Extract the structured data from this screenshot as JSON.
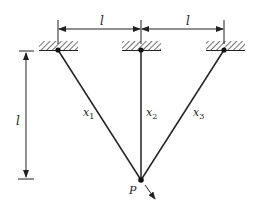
{
  "diagram": {
    "type": "three-bar truss / hanging cables",
    "labels": {
      "top_dim_left": "l",
      "top_dim_right": "l",
      "vertical_dim": "l",
      "bar1": "x",
      "bar1_sub": "1",
      "bar2": "x",
      "bar2_sub": "2",
      "bar3": "x",
      "bar3_sub": "3",
      "load_point": "P"
    },
    "supports": [
      {
        "name": "support-left",
        "x": 58,
        "y": 50
      },
      {
        "name": "support-middle",
        "x": 141,
        "y": 50
      },
      {
        "name": "support-right",
        "x": 224,
        "y": 50
      }
    ],
    "node": {
      "x": 141,
      "y": 180
    },
    "colors": {
      "line": "#222222",
      "background": "#ffffff"
    }
  }
}
